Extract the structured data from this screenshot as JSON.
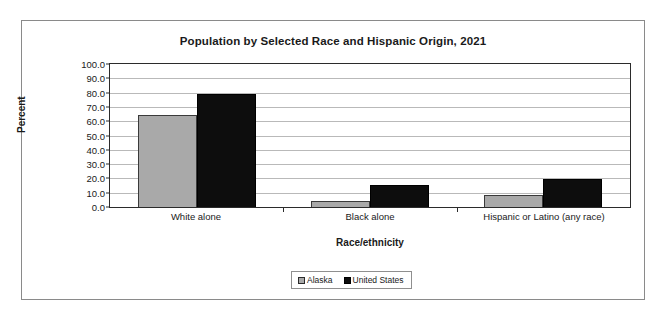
{
  "chart_data": {
    "type": "bar",
    "title": "Population by Selected Race and Hispanic Origin, 2021",
    "xlabel": "Race/ethnicity",
    "ylabel": "Percent",
    "categories": [
      "White alone",
      "Black alone",
      "Hispanic or Latino (any race)"
    ],
    "series": [
      {
        "name": "Alaska",
        "color": "#a9a9a9",
        "values": [
          64.5,
          4.0,
          8.3
        ]
      },
      {
        "name": "United States",
        "color": "#0d0d0d",
        "values": [
          78.8,
          15.2,
          19.5
        ]
      }
    ],
    "ylim": [
      0,
      100
    ],
    "ytick_step": 10,
    "ytick_labels": [
      "100.0",
      "90.0",
      "80.0",
      "70.0",
      "60.0",
      "50.0",
      "40.0",
      "30.0",
      "20.0",
      "10.0",
      "0.0"
    ],
    "ytick_values": [
      100,
      90,
      80,
      70,
      60,
      50,
      40,
      30,
      20,
      10,
      0
    ],
    "grid": true,
    "legend_position": "bottom"
  },
  "legend": {
    "items": [
      {
        "label": "Alaska",
        "swatch": "alaska"
      },
      {
        "label": "United States",
        "swatch": "us"
      }
    ]
  },
  "colors": {
    "alaska": "#a9a9a9",
    "united_states": "#0d0d0d",
    "gridline": "#b9b9b9",
    "axis": "#2b2b2b",
    "frame": "#8a8a8a",
    "background": "#ffffff"
  }
}
